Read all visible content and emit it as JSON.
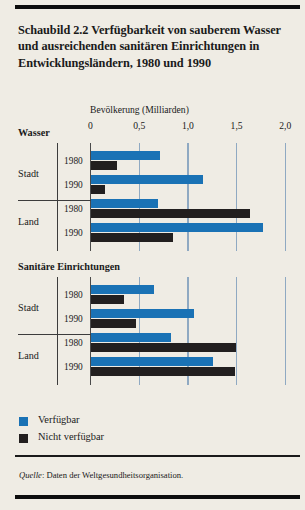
{
  "figure": {
    "title": "Schaubild 2.2   Verfügbarkeit von sauberem Wasser und ausreichenden sanitären Einrichtungen in Entwicklungsländern, 1980 und 1990",
    "source_prefix": "Quelle",
    "source_text": ": Daten der Weltgesundheitsorganisation."
  },
  "legend": {
    "items": [
      {
        "label": "Verfügbar",
        "color": "#1a72b5",
        "key": "avail"
      },
      {
        "label": "Nicht verfügbar",
        "color": "#221f1f",
        "key": "unavail"
      }
    ]
  },
  "axis": {
    "title": "Bevölkerung (Milliarden)",
    "ticks": [
      "0",
      "0,5",
      "1,0",
      "1,5",
      "2,0"
    ],
    "tick_values": [
      0,
      0.5,
      1.0,
      1.5,
      2.0
    ]
  },
  "sections": [
    {
      "label": "Wasser"
    },
    {
      "label": "Sanitäre Einrichtungen"
    }
  ],
  "groups": [
    {
      "label": "Stadt"
    },
    {
      "label": "Land"
    },
    {
      "label": "Stadt"
    },
    {
      "label": "Land"
    }
  ],
  "years": [
    "1980",
    "1990",
    "1980",
    "1990",
    "1980",
    "1990",
    "1980",
    "1990"
  ],
  "chart_data": {
    "type": "bar",
    "orientation": "horizontal",
    "title": "Schaubild 2.2   Verfügbarkeit von sauberem Wasser und ausreichenden sanitären Einrichtungen in Entwicklungsländern, 1980 und 1990",
    "xlabel": "Bevölkerung (Milliarden)",
    "ylabel": "",
    "xlim": [
      0,
      2.0
    ],
    "xticks": [
      0,
      0.5,
      1.0,
      1.5,
      2.0
    ],
    "xticklabels": [
      "0",
      "0,5",
      "1,0",
      "1,5",
      "2,0"
    ],
    "grid": true,
    "legend_position": "bottom-left",
    "series": [
      {
        "name": "Verfügbar",
        "color": "#1a72b5"
      },
      {
        "name": "Nicht verfügbar",
        "color": "#221f1f"
      }
    ],
    "panels": [
      {
        "name": "Wasser",
        "rows": [
          {
            "group": "Stadt",
            "year": "1980",
            "Verfügbar": 0.71,
            "Nicht verfügbar": 0.27
          },
          {
            "group": "Stadt",
            "year": "1990",
            "Verfügbar": 1.16,
            "Nicht verfügbar": 0.15
          },
          {
            "group": "Land",
            "year": "1980",
            "Verfügbar": 0.69,
            "Nicht verfügbar": 1.64
          },
          {
            "group": "Land",
            "year": "1990",
            "Verfügbar": 1.77,
            "Nicht verfügbar": 0.85
          }
        ]
      },
      {
        "name": "Sanitäre Einrichtungen",
        "rows": [
          {
            "group": "Stadt",
            "year": "1980",
            "Verfügbar": 0.65,
            "Nicht verfügbar": 0.34
          },
          {
            "group": "Stadt",
            "year": "1990",
            "Verfügbar": 1.06,
            "Nicht verfügbar": 0.47
          },
          {
            "group": "Land",
            "year": "1980",
            "Verfügbar": 0.83,
            "Nicht verfügbar": 1.49
          },
          {
            "group": "Land",
            "year": "1990",
            "Verfügbar": 1.26,
            "Nicht verfügbar": 1.48
          }
        ]
      }
    ]
  }
}
